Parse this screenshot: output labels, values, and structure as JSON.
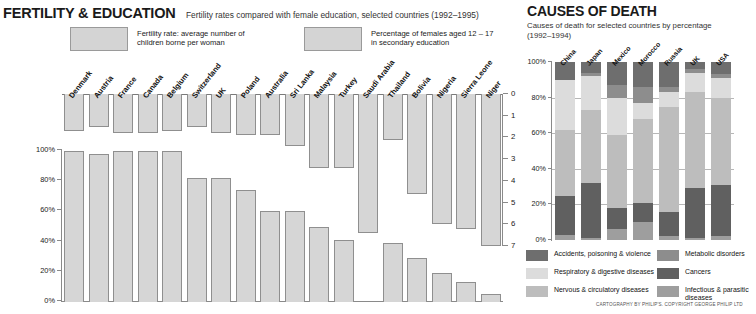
{
  "fertility": {
    "title": "FERTILITY & EDUCATION",
    "subtitle": "Fertility rates compared with female education, selected countries (1992–1995)",
    "legend": [
      {
        "label_line1": "Fertility rate: average number of",
        "label_line2": "children borne per woman",
        "color": "#d4d4d4"
      },
      {
        "label_line1": "Percentage of females aged 12 – 17",
        "label_line2": "in secondary education",
        "color": "#d4d4d4"
      }
    ],
    "left_axis_ticks": [
      "100%",
      "80%",
      "60%",
      "40%",
      "20%",
      "0%"
    ],
    "right_axis_ticks": [
      "0",
      "1",
      "2",
      "3",
      "4",
      "5",
      "6",
      "7"
    ]
  },
  "causes": {
    "title": "CAUSES OF DEATH",
    "subtitle_line1": "Causes of death for selected countries by percentage",
    "subtitle_line2": "(1992–1994)",
    "axis_ticks": [
      "100%",
      "80%",
      "60%",
      "40%",
      "20%",
      "0%"
    ],
    "legend": [
      {
        "label": "Accidents, poisoning & violence",
        "color": "#6e6e6e"
      },
      {
        "label": "Respiratory & digestive diseases",
        "color": "#dcdcdc"
      },
      {
        "label": "Nervous & circulatory diseases",
        "color": "#bdbdbd"
      },
      {
        "label": "Metabolic disorders",
        "color": "#8d8d8d"
      },
      {
        "label": "Cancers",
        "color": "#606060"
      },
      {
        "label": "Infectious & parasitic diseases",
        "color": "#9e9e9e"
      }
    ]
  },
  "credit": "CARTOGRAPHY BY PHILIP'S. COPYRIGHT GEORGE PHILIP LTD",
  "chart_data": [
    {
      "type": "bar",
      "title": "FERTILITY & EDUCATION",
      "subtitle": "Fertility rates compared with female education, selected countries (1992–1995)",
      "xlabel": "",
      "ylabel_left": "Percentage of females aged 12 – 17 in secondary education",
      "ylabel_right": "Fertility rate: average number of children borne per woman",
      "ylim_left": [
        0,
        100
      ],
      "ylim_right": [
        0,
        7
      ],
      "right_axis_inverted": true,
      "grid": false,
      "legend_position": "top",
      "categories": [
        "Denmark",
        "Austria",
        "France",
        "Canada",
        "Belgium",
        "Switzerland",
        "UK",
        "Poland",
        "Australia",
        "Sri Lanka",
        "Malaysia",
        "Turkey",
        "Saudi Arabia",
        "Thailand",
        "Bolivia",
        "Nigeria",
        "Sierra Leone",
        "Niger"
      ],
      "series": [
        {
          "name": "Fertility rate: average number of children borne per woman",
          "unit": "children per woman",
          "values": [
            1.7,
            1.5,
            1.8,
            1.8,
            1.7,
            1.5,
            1.8,
            1.9,
            1.9,
            2.4,
            3.4,
            3.4,
            6.4,
            2.1,
            4.6,
            6.0,
            6.2,
            7.0
          ]
        },
        {
          "name": "Percentage of females aged 12 – 17 in secondary education",
          "unit": "%",
          "values": [
            100,
            98,
            100,
            100,
            100,
            82,
            82,
            74,
            60,
            60,
            50,
            41,
            0,
            39,
            29,
            19,
            13,
            5
          ]
        }
      ]
    },
    {
      "type": "bar",
      "stacked": true,
      "title": "CAUSES OF DEATH",
      "subtitle": "Causes of death for selected countries by percentage (1992–1994)",
      "xlabel": "",
      "ylabel": "Percentage",
      "ylim": [
        0,
        100
      ],
      "grid": true,
      "legend_position": "bottom",
      "categories": [
        "China",
        "Japan",
        "Mexico",
        "Morocco",
        "Russia",
        "UK",
        "USA"
      ],
      "series": [
        {
          "name": "Infectious & parasitic diseases",
          "color": "#9e9e9e",
          "values": [
            3,
            1,
            6,
            10,
            2,
            1,
            2
          ]
        },
        {
          "name": "Cancers",
          "color": "#606060",
          "values": [
            22,
            31,
            12,
            11,
            14,
            28,
            29
          ]
        },
        {
          "name": "Nervous & circulatory diseases",
          "color": "#bdbdbd",
          "values": [
            37,
            41,
            41,
            47,
            59,
            54,
            49
          ]
        },
        {
          "name": "Respiratory & digestive diseases",
          "color": "#dcdcdc",
          "values": [
            28,
            19,
            21,
            9,
            8,
            11,
            11
          ]
        },
        {
          "name": "Metabolic disorders",
          "color": "#8d8d8d",
          "values": [
            0,
            2,
            7,
            9,
            3,
            2,
            2
          ]
        },
        {
          "name": "Accidents, poisoning & violence",
          "color": "#6e6e6e",
          "values": [
            10,
            6,
            13,
            14,
            14,
            4,
            7
          ]
        }
      ]
    }
  ]
}
